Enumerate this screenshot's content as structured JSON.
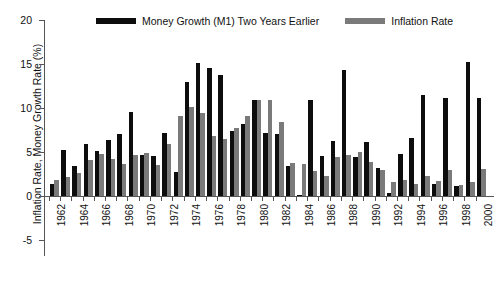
{
  "chart_data": {
    "type": "bar",
    "title": "",
    "xlabel": "",
    "ylabel": "Inflation Rate, Money Growth Rate (%)",
    "ylim": [
      -5,
      20
    ],
    "yticks": [
      -5,
      0,
      5,
      10,
      15,
      20
    ],
    "ytick_labels": [
      "-5",
      "0",
      "5",
      "10",
      "15",
      "20"
    ],
    "grid": false,
    "legend_position": "top-center",
    "categories": [
      1962,
      1963,
      1964,
      1965,
      1966,
      1967,
      1968,
      1969,
      1970,
      1971,
      1972,
      1973,
      1974,
      1975,
      1976,
      1977,
      1978,
      1979,
      1980,
      1981,
      1982,
      1983,
      1984,
      1985,
      1986,
      1987,
      1988,
      1989,
      1990,
      1991,
      1992,
      1993,
      1994,
      1995,
      1996,
      1997,
      1998,
      1999,
      2000
    ],
    "xtick_labels": [
      "1962",
      "1964",
      "1966",
      "1968",
      "1970",
      "1972",
      "1974",
      "1976",
      "1978",
      "1980",
      "1982",
      "1984",
      "1986",
      "1988",
      "1990",
      "1992",
      "1994",
      "1996",
      "1998",
      "2000"
    ],
    "series": [
      {
        "name": "Money Growth (M1) Two Years Earlier",
        "color": "#0d0d0d",
        "values": [
          1.4,
          5.2,
          3.4,
          5.9,
          5.1,
          6.4,
          7.1,
          9.6,
          4.7,
          4.6,
          7.2,
          2.7,
          12.9,
          15.1,
          14.6,
          13.7,
          7.4,
          8.2,
          10.9,
          7.2,
          7.1,
          3.4,
          0.1,
          10.9,
          4.6,
          6.3,
          14.3,
          4.4,
          6.1,
          3.2,
          0.3,
          4.8,
          6.6,
          11.5,
          1.4,
          11.1,
          1.1,
          15.2,
          11.1
        ],
        "axis": "y"
      },
      {
        "name": "Inflation Rate",
        "color": "#7a7a7a",
        "values": [
          1.8,
          2.2,
          2.6,
          4.1,
          4.8,
          4.2,
          3.6,
          4.7,
          4.9,
          3.5,
          5.9,
          9.1,
          10.1,
          9.4,
          6.8,
          6.5,
          7.7,
          9.1,
          10.9,
          10.9,
          8.4,
          3.8,
          3.6,
          2.8,
          2.3,
          4.4,
          4.7,
          5.0,
          3.9,
          3.0,
          1.6,
          1.8,
          1.4,
          2.3,
          1.7,
          2.9,
          1.3,
          1.6,
          3.1
        ],
        "axis": "y"
      }
    ]
  },
  "legend": {
    "entries": [
      {
        "label": "Money Growth (M1) Two Years Earlier",
        "swatch": "money"
      },
      {
        "label": "Inflation Rate",
        "swatch": "inflation"
      }
    ]
  },
  "colors": {
    "money_growth": "#0d0d0d",
    "inflation": "#7a7a7a",
    "axis": "#555555",
    "text": "#111111",
    "background": "#ffffff"
  }
}
